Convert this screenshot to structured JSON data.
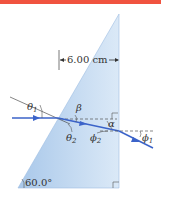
{
  "figure": {
    "top_bar_color": "#f0533f",
    "prism_color_light": "#dbe9f7",
    "prism_color_dark": "#a9c8ea",
    "ray_color": "#3b63c9",
    "dimension": {
      "label": "6.00 cm"
    },
    "angles": {
      "theta1": "θ",
      "theta1_sub": "1",
      "theta2": "θ",
      "theta2_sub": "2",
      "beta": "β",
      "alpha": "α",
      "phi2": "ϕ",
      "phi2_sub": "2",
      "phi1": "ϕ",
      "phi1_sub": "1",
      "apex_angle": "60.0°"
    },
    "icons": {
      "incident-arrow": "arrow-right",
      "refracted-arrow": "arrow-right",
      "exit-arrow": "arrow-right",
      "right-angle-marker-top": "right-angle",
      "right-angle-marker-bottom": "right-angle"
    }
  }
}
